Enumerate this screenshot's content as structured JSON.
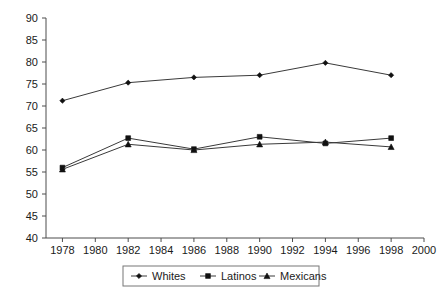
{
  "chart_data": {
    "type": "line",
    "title": "",
    "xlabel": "",
    "ylabel": "",
    "x": [
      1978,
      1982,
      1986,
      1990,
      1994,
      1998
    ],
    "xlim": [
      1977,
      2000
    ],
    "ylim": [
      40,
      90
    ],
    "xticks": [
      1978,
      1980,
      1982,
      1984,
      1986,
      1988,
      1990,
      1992,
      1994,
      1996,
      1998,
      2000
    ],
    "yticks": [
      40,
      45,
      50,
      55,
      60,
      65,
      70,
      75,
      80,
      85,
      90
    ],
    "grid": false,
    "legend_position": "bottom-center",
    "series": [
      {
        "name": "Whites",
        "marker": "diamond",
        "values": [
          71.2,
          75.3,
          76.5,
          77.0,
          79.8,
          77.0
        ]
      },
      {
        "name": "Latinos",
        "marker": "square",
        "values": [
          56.0,
          62.7,
          60.2,
          63.0,
          61.5,
          62.7
        ]
      },
      {
        "name": "Mexicans",
        "marker": "triangle",
        "values": [
          55.6,
          61.3,
          60.0,
          61.3,
          61.8,
          60.7
        ]
      }
    ]
  },
  "axis": {
    "ytick_labels": [
      "90",
      "85",
      "80",
      "75",
      "70",
      "65",
      "60",
      "55",
      "50",
      "45",
      "40"
    ],
    "xtick_labels": [
      "1978",
      "1980",
      "1982",
      "1984",
      "1986",
      "1988",
      "1990",
      "1992",
      "1994",
      "1996",
      "1998",
      "2000"
    ]
  },
  "legend": {
    "entries": [
      {
        "label": "Whites",
        "marker": "diamond"
      },
      {
        "label": "Latinos",
        "marker": "square"
      },
      {
        "label": "Mexicans",
        "marker": "triangle"
      }
    ]
  },
  "colors": {
    "line": "#3a3a3a",
    "marker": "#111111",
    "axis": "#4d4d4d",
    "text": "#1a1a1a",
    "background": "#ffffff",
    "legend_border": "#777777"
  }
}
